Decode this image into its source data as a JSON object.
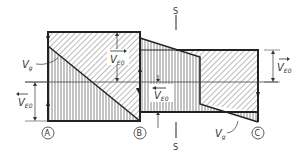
{
  "diagram": {
    "type": "shear-force diagram with sections",
    "labels": {
      "vg_left": "V",
      "vg_left_sub": "g",
      "vg_right": "V",
      "vg_right_sub": "g",
      "ve0_top": "V",
      "ve0_top_sub": "E0",
      "ve0_left": "V",
      "ve0_left_sub": "E0",
      "ve0_mid": "V",
      "ve0_mid_sub": "E0",
      "ve0_right": "V",
      "ve0_right_sub": "E0",
      "section_top": "S",
      "section_bottom": "S"
    },
    "nodes": [
      {
        "id": "A",
        "label": "A"
      },
      {
        "id": "B",
        "label": "B"
      },
      {
        "id": "C",
        "label": "C"
      }
    ],
    "colors": {
      "line": "#222222",
      "hatch": "#555555",
      "background": "#ffffff"
    }
  }
}
